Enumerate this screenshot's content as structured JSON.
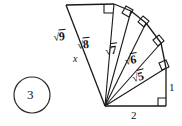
{
  "figure": {
    "problem_number": "3",
    "unknown_label": "x",
    "stroke_color": "#1a1a1a",
    "background_color": "#ffffff",
    "labels": {
      "base": "2",
      "vertical": "1",
      "hyp_5": "5",
      "hyp_6": "6",
      "hyp_7": "7",
      "hyp_8": "8",
      "hyp_9": "9",
      "radical_sign": "√"
    },
    "geometry": {
      "apex": [
        105,
        106
      ],
      "base_end": [
        166,
        106
      ],
      "vertical_top": [
        166,
        68
      ],
      "spiral_vertices": [
        [
          166,
          106
        ],
        [
          166,
          68
        ],
        [
          161,
          43
        ],
        [
          146,
          23
        ],
        [
          131,
          11
        ],
        [
          114,
          4
        ],
        [
          66,
          5
        ]
      ],
      "base_length": 2,
      "vertical_length": 1
    }
  }
}
